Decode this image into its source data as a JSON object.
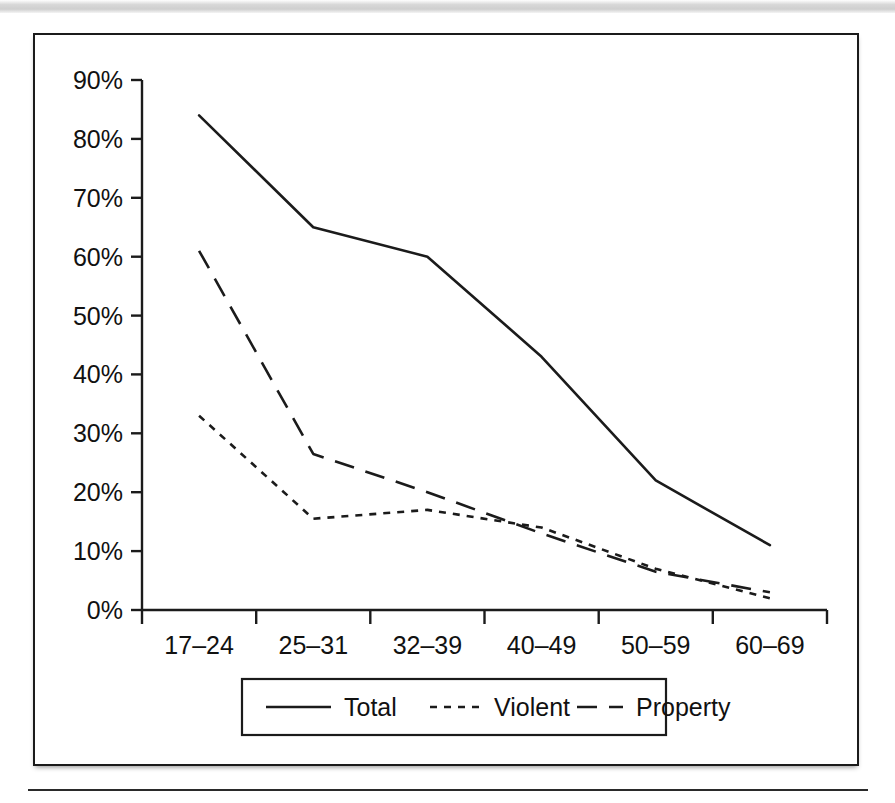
{
  "figure": {
    "background_color": "#ffffff",
    "frame_color": "#1b1b1b"
  },
  "chart_data": {
    "type": "line",
    "title": "",
    "subtitle": "",
    "xlabel": "",
    "ylabel": "",
    "categories": [
      "17–24",
      "25–31",
      "32–39",
      "40–49",
      "50–59",
      "60–69"
    ],
    "ytick_labels": [
      "0%",
      "10%",
      "20%",
      "30%",
      "40%",
      "50%",
      "60%",
      "70%",
      "80%",
      "90%"
    ],
    "ytick_values": [
      0,
      10,
      20,
      30,
      40,
      50,
      60,
      70,
      80,
      90
    ],
    "ylim": [
      0,
      90
    ],
    "grid": false,
    "legend_position": "bottom",
    "series": [
      {
        "name": "Total",
        "style": "solid",
        "color": "#1b1b1b",
        "values": [
          84,
          65,
          60,
          43,
          22,
          11
        ]
      },
      {
        "name": "Violent",
        "style": "dotted",
        "color": "#1b1b1b",
        "values": [
          33,
          15.5,
          17,
          14,
          7,
          2
        ]
      },
      {
        "name": "Property",
        "style": "dashed",
        "color": "#1b1b1b",
        "values": [
          61,
          26.5,
          20,
          13,
          6.5,
          3
        ]
      }
    ]
  },
  "legend": {
    "items": [
      {
        "label": "Total",
        "style": "solid"
      },
      {
        "label": "Violent",
        "style": "dotted"
      },
      {
        "label": "Property",
        "style": "dashed"
      }
    ]
  },
  "ytick_labels": {
    "t0": "0%",
    "t1": "10%",
    "t2": "20%",
    "t3": "30%",
    "t4": "40%",
    "t5": "50%",
    "t6": "60%",
    "t7": "70%",
    "t8": "80%",
    "t9": "90%"
  },
  "xtick_labels": {
    "c0": "17–24",
    "c1": "25–31",
    "c2": "32–39",
    "c3": "40–49",
    "c4": "50–59",
    "c5": "60–69"
  }
}
